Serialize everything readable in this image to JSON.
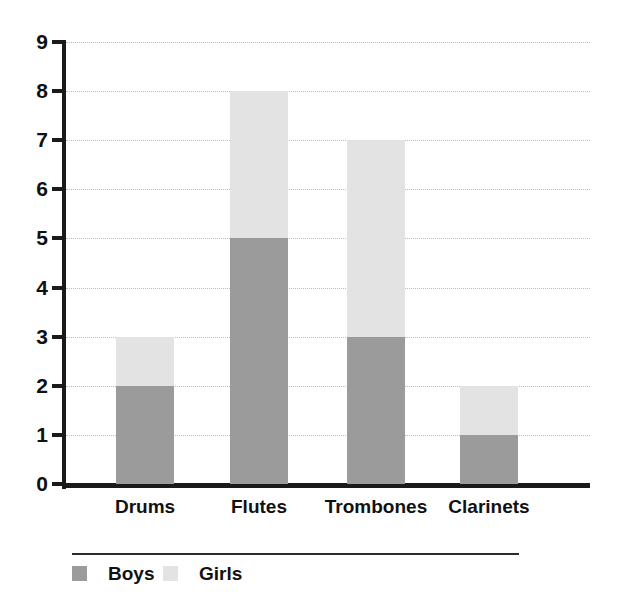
{
  "chart_data": {
    "type": "bar",
    "subtype": "stacked-vertical",
    "title": "",
    "xlabel": "",
    "ylabel": "",
    "categories": [
      "Drums",
      "Flutes",
      "Trombones",
      "Clarinets"
    ],
    "series": [
      {
        "name": "Boys",
        "color": "#9b9b9b",
        "values": [
          2,
          5,
          3,
          1
        ]
      },
      {
        "name": "Girls",
        "color": "#e3e3e3",
        "values": [
          1,
          3,
          4,
          1
        ]
      }
    ],
    "totals": [
      3,
      8,
      7,
      2
    ],
    "ylim": [
      0,
      9
    ],
    "ytick_labels": [
      "0",
      "1",
      "2",
      "3",
      "4",
      "5",
      "6",
      "7",
      "8",
      "9"
    ],
    "ytick_values": [
      0,
      1,
      2,
      3,
      4,
      5,
      6,
      7,
      8,
      9
    ],
    "grid": true,
    "grid_style": "dotted",
    "grid_axis": "y",
    "legend_position": "bottom",
    "legend_entries": [
      "Boys",
      "Girls"
    ]
  },
  "axis": {
    "y_tick_labels": [
      "9",
      "8",
      "7",
      "6",
      "5",
      "4",
      "3",
      "2",
      "1",
      "0"
    ]
  },
  "legend": {
    "items": [
      {
        "label": "Boys",
        "color": "#9b9b9b"
      },
      {
        "label": "Girls",
        "color": "#e3e3e3"
      }
    ]
  }
}
